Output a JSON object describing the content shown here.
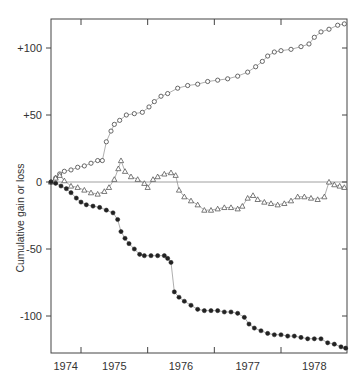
{
  "chart_data": {
    "type": "scatter",
    "title": "",
    "xlabel": "",
    "ylabel": "Cumulative gain or loss",
    "xlim": [
      1974.55,
      1978.99
    ],
    "ylim": [
      -125,
      124
    ],
    "x_tick_labels": [
      "1974",
      "1975",
      "1976",
      "1977",
      "1978"
    ],
    "x_tick_label_positions": [
      1974.77,
      1975.5,
      1976.5,
      1977.5,
      1978.5
    ],
    "x_tick_marks": [
      1975.0,
      1976.0,
      1977.0,
      1978.0
    ],
    "y_ticks": [
      100,
      50,
      0,
      -50,
      -100
    ],
    "y_tick_labels": [
      "+100",
      "+50",
      "0",
      "-50",
      "-100"
    ],
    "zero_line": true,
    "grid": false,
    "legend": null,
    "series": [
      {
        "name": "open-circles",
        "marker": "circle-open",
        "points": [
          [
            1974.55,
            0
          ],
          [
            1974.62,
            3
          ],
          [
            1974.68,
            6
          ],
          [
            1974.75,
            8
          ],
          [
            1974.85,
            9
          ],
          [
            1974.95,
            11
          ],
          [
            1975.05,
            12
          ],
          [
            1975.15,
            14
          ],
          [
            1975.25,
            16
          ],
          [
            1975.32,
            16
          ],
          [
            1975.38,
            30
          ],
          [
            1975.45,
            38
          ],
          [
            1975.5,
            43
          ],
          [
            1975.58,
            46
          ],
          [
            1975.68,
            50
          ],
          [
            1975.8,
            51
          ],
          [
            1975.92,
            52
          ],
          [
            1976.02,
            56
          ],
          [
            1976.1,
            60
          ],
          [
            1976.2,
            64
          ],
          [
            1976.3,
            66
          ],
          [
            1976.45,
            70
          ],
          [
            1976.6,
            72
          ],
          [
            1976.75,
            73
          ],
          [
            1976.9,
            75
          ],
          [
            1977.05,
            76
          ],
          [
            1977.2,
            77
          ],
          [
            1977.35,
            79
          ],
          [
            1977.5,
            82
          ],
          [
            1977.62,
            86
          ],
          [
            1977.72,
            90
          ],
          [
            1977.8,
            94
          ],
          [
            1977.9,
            97
          ],
          [
            1978.0,
            98
          ],
          [
            1978.15,
            99
          ],
          [
            1978.3,
            101
          ],
          [
            1978.42,
            103
          ],
          [
            1978.5,
            108
          ],
          [
            1978.6,
            112
          ],
          [
            1978.72,
            114
          ],
          [
            1978.85,
            117
          ],
          [
            1978.95,
            118
          ]
        ]
      },
      {
        "name": "open-triangles",
        "marker": "triangle-open",
        "points": [
          [
            1974.55,
            0
          ],
          [
            1974.62,
            3
          ],
          [
            1974.68,
            5
          ],
          [
            1974.75,
            1
          ],
          [
            1974.85,
            -3
          ],
          [
            1974.95,
            -4
          ],
          [
            1975.05,
            -6
          ],
          [
            1975.15,
            -8
          ],
          [
            1975.25,
            -9
          ],
          [
            1975.35,
            -7
          ],
          [
            1975.42,
            -4
          ],
          [
            1975.5,
            2
          ],
          [
            1975.56,
            10
          ],
          [
            1975.6,
            16
          ],
          [
            1975.66,
            8
          ],
          [
            1975.75,
            4
          ],
          [
            1975.85,
            2
          ],
          [
            1975.95,
            -1
          ],
          [
            1976.0,
            -4
          ],
          [
            1976.08,
            2
          ],
          [
            1976.15,
            4
          ],
          [
            1976.25,
            6
          ],
          [
            1976.35,
            7
          ],
          [
            1976.42,
            5
          ],
          [
            1976.47,
            -6
          ],
          [
            1976.55,
            -11
          ],
          [
            1976.65,
            -14
          ],
          [
            1976.75,
            -17
          ],
          [
            1976.85,
            -21
          ],
          [
            1976.95,
            -21
          ],
          [
            1977.05,
            -20
          ],
          [
            1977.15,
            -19
          ],
          [
            1977.25,
            -19
          ],
          [
            1977.35,
            -20
          ],
          [
            1977.42,
            -18
          ],
          [
            1977.5,
            -12
          ],
          [
            1977.58,
            -10
          ],
          [
            1977.65,
            -13
          ],
          [
            1977.75,
            -15
          ],
          [
            1977.85,
            -16
          ],
          [
            1977.95,
            -17
          ],
          [
            1978.05,
            -16
          ],
          [
            1978.15,
            -14
          ],
          [
            1978.25,
            -11
          ],
          [
            1978.35,
            -11
          ],
          [
            1978.45,
            -12
          ],
          [
            1978.55,
            -13
          ],
          [
            1978.65,
            -11
          ],
          [
            1978.72,
            0
          ],
          [
            1978.8,
            -2
          ],
          [
            1978.88,
            -3
          ],
          [
            1978.95,
            -4
          ]
        ]
      },
      {
        "name": "filled-dots",
        "marker": "circle-filled",
        "points": [
          [
            1974.55,
            0
          ],
          [
            1974.62,
            -1
          ],
          [
            1974.7,
            -3
          ],
          [
            1974.78,
            -5
          ],
          [
            1974.85,
            -8
          ],
          [
            1974.93,
            -12
          ],
          [
            1975.0,
            -15
          ],
          [
            1975.08,
            -17
          ],
          [
            1975.18,
            -18
          ],
          [
            1975.28,
            -19
          ],
          [
            1975.38,
            -21
          ],
          [
            1975.48,
            -23
          ],
          [
            1975.55,
            -28
          ],
          [
            1975.6,
            -37
          ],
          [
            1975.66,
            -42
          ],
          [
            1975.72,
            -46
          ],
          [
            1975.8,
            -50
          ],
          [
            1975.88,
            -54
          ],
          [
            1975.95,
            -55
          ],
          [
            1976.05,
            -55
          ],
          [
            1976.15,
            -55
          ],
          [
            1976.25,
            -55
          ],
          [
            1976.3,
            -57
          ],
          [
            1976.35,
            -60
          ],
          [
            1976.4,
            -82
          ],
          [
            1976.47,
            -86
          ],
          [
            1976.55,
            -89
          ],
          [
            1976.65,
            -92
          ],
          [
            1976.75,
            -95
          ],
          [
            1976.85,
            -96
          ],
          [
            1976.95,
            -96
          ],
          [
            1977.05,
            -96
          ],
          [
            1977.15,
            -97
          ],
          [
            1977.25,
            -97
          ],
          [
            1977.35,
            -98
          ],
          [
            1977.45,
            -101
          ],
          [
            1977.52,
            -106
          ],
          [
            1977.6,
            -109
          ],
          [
            1977.7,
            -111
          ],
          [
            1977.8,
            -113
          ],
          [
            1977.9,
            -114
          ],
          [
            1978.0,
            -114
          ],
          [
            1978.1,
            -115
          ],
          [
            1978.2,
            -115
          ],
          [
            1978.3,
            -116
          ],
          [
            1978.4,
            -117
          ],
          [
            1978.5,
            -117
          ],
          [
            1978.6,
            -117
          ],
          [
            1978.7,
            -120
          ],
          [
            1978.8,
            -121
          ],
          [
            1978.9,
            -123
          ],
          [
            1978.97,
            -124
          ]
        ]
      }
    ]
  },
  "axis": {
    "y_label": "Cumulative gain or loss"
  }
}
